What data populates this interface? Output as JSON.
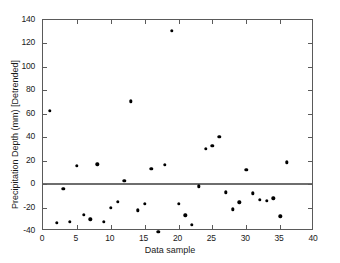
{
  "chart_data": {
    "type": "scatter",
    "title": "",
    "xlabel": "Data sample",
    "ylabel": "Precipitation Depth (mm) [Detrended]",
    "xlim": [
      0,
      40
    ],
    "ylim": [
      -40,
      140
    ],
    "xticks": [
      0,
      5,
      10,
      15,
      20,
      25,
      30,
      35,
      40
    ],
    "xticklabels": [
      "0",
      "5",
      "10",
      "15",
      "20",
      "25",
      "30",
      "35",
      "40"
    ],
    "yticks": [
      -40,
      -20,
      0,
      20,
      40,
      60,
      80,
      100,
      120,
      140
    ],
    "yticklabels": [
      "-40",
      "-20",
      "0",
      "20",
      "40",
      "60",
      "80",
      "100",
      "120",
      "140"
    ],
    "grid": false,
    "legend": null,
    "marker": "filled-circle",
    "marker_color": "#000000",
    "zero_line": 0,
    "zero_line_color": "#6e6e6e",
    "x": [
      1,
      2,
      3,
      4,
      5,
      6,
      7,
      8,
      9,
      10,
      11,
      12,
      13,
      14,
      15,
      16,
      17,
      18,
      19,
      20,
      21,
      22,
      23,
      24,
      25,
      26,
      27,
      28,
      29,
      30,
      31,
      32,
      33,
      34,
      35,
      36
    ],
    "y": [
      62.5,
      -33,
      -4,
      -32,
      15.5,
      -26,
      -30,
      17,
      -32,
      -20,
      -15,
      3,
      70.5,
      -22.5,
      -17,
      13,
      -40.5,
      16.5,
      131,
      -17,
      -26.5,
      -34.5,
      -2,
      30,
      32.5,
      40.5,
      -7,
      -21.5,
      -15.5,
      12,
      -8,
      -13.5,
      -14.5,
      -12,
      -27.5,
      18.5
    ],
    "points": [
      {
        "x": 1,
        "y": 62.5
      },
      {
        "x": 2,
        "y": -33
      },
      {
        "x": 3,
        "y": -4
      },
      {
        "x": 4,
        "y": -32
      },
      {
        "x": 5,
        "y": 15.5
      },
      {
        "x": 6,
        "y": -26
      },
      {
        "x": 7,
        "y": -30
      },
      {
        "x": 8,
        "y": 17
      },
      {
        "x": 9,
        "y": -32
      },
      {
        "x": 10,
        "y": -20
      },
      {
        "x": 11,
        "y": -15
      },
      {
        "x": 12,
        "y": 3
      },
      {
        "x": 13,
        "y": 70.5
      },
      {
        "x": 14,
        "y": -22.5
      },
      {
        "x": 15,
        "y": -17
      },
      {
        "x": 16,
        "y": 13
      },
      {
        "x": 17,
        "y": -40.5
      },
      {
        "x": 18,
        "y": 16.5
      },
      {
        "x": 19,
        "y": 131
      },
      {
        "x": 20,
        "y": -17
      },
      {
        "x": 21,
        "y": -26.5
      },
      {
        "x": 22,
        "y": -34.5
      },
      {
        "x": 23,
        "y": -2
      },
      {
        "x": 24,
        "y": 30
      },
      {
        "x": 25,
        "y": 32.5
      },
      {
        "x": 26,
        "y": 40.5
      },
      {
        "x": 27,
        "y": -7
      },
      {
        "x": 28,
        "y": -21.5
      },
      {
        "x": 29,
        "y": -15.5
      },
      {
        "x": 30,
        "y": 12
      },
      {
        "x": 31,
        "y": -8
      },
      {
        "x": 32,
        "y": -13.5
      },
      {
        "x": 33,
        "y": -14.5
      },
      {
        "x": 34,
        "y": -12
      },
      {
        "x": 35,
        "y": -27.5
      },
      {
        "x": 36,
        "y": 18.5
      }
    ]
  }
}
